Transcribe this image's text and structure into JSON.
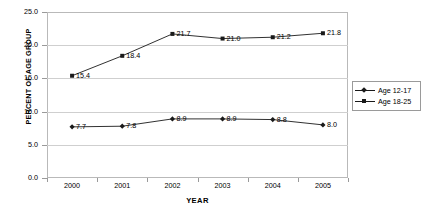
{
  "chart_data": {
    "type": "line",
    "title": "",
    "xlabel": "YEAR",
    "ylabel": "PERCENT OF AGE GROUP",
    "categories": [
      "2000",
      "2001",
      "2002",
      "2003",
      "2004",
      "2005"
    ],
    "ylim": [
      0.0,
      25.0
    ],
    "yticks": [
      "0.0",
      "5.0",
      "10.0",
      "15.0",
      "20.0",
      "25.0"
    ],
    "grid": true,
    "legend_position": "right",
    "series": [
      {
        "name": "Age 12-17",
        "marker": "diamond",
        "values": [
          7.7,
          7.8,
          8.9,
          8.9,
          8.8,
          8.0
        ],
        "labels": [
          "7.7",
          "7.8",
          "8.9",
          "8.9",
          "8.8",
          "8.0"
        ]
      },
      {
        "name": "Age 18-25",
        "marker": "square",
        "values": [
          15.4,
          18.4,
          21.7,
          21.0,
          21.2,
          21.8
        ],
        "labels": [
          "15.4",
          "18.4",
          "21.7",
          "21.0",
          "21.2",
          "21.8"
        ]
      }
    ]
  },
  "legend": {
    "items": [
      {
        "label": "Age 12-17"
      },
      {
        "label": "Age 18-25"
      }
    ]
  },
  "colors": {
    "series_line": "#1a1a1a",
    "grid": "#cfcfcf",
    "frame": "#b9b9b9",
    "text": "#000000",
    "background": "#ffffff"
  }
}
